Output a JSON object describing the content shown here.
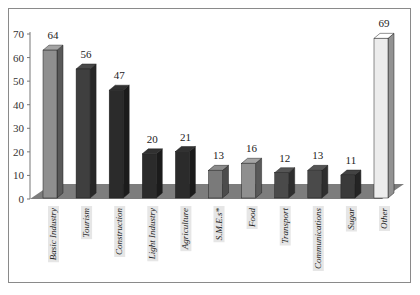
{
  "chart_data": {
    "type": "bar",
    "style": "3d-column",
    "title": "",
    "xlabel": "",
    "ylabel": "",
    "ylim": [
      0,
      70
    ],
    "yticks": [
      0,
      10,
      20,
      30,
      40,
      50,
      60,
      70
    ],
    "grid": false,
    "legend": null,
    "categories": [
      "Basic Industry",
      "Tourism",
      "Construction",
      "Light Industry",
      "Agriculture",
      "S.M.E.s*",
      "Food",
      "Transport",
      "Communications",
      "Sugar",
      "Other"
    ],
    "values": [
      64,
      56,
      47,
      20,
      21,
      13,
      16,
      12,
      13,
      11,
      69
    ],
    "data_labels": [
      "64",
      "56",
      "47",
      "20",
      "21",
      "13",
      "16",
      "12",
      "13",
      "11",
      "69"
    ],
    "bar_colors": [
      "#8f8f8f",
      "#3f3f3f",
      "#2b2b2b",
      "#2b2b2b",
      "#2b2b2b",
      "#7a7a7a",
      "#8f8f8f",
      "#4a4a4a",
      "#4a4a4a",
      "#3a3a3a",
      "#ececec"
    ],
    "floor_color": "#7d7d7d"
  }
}
